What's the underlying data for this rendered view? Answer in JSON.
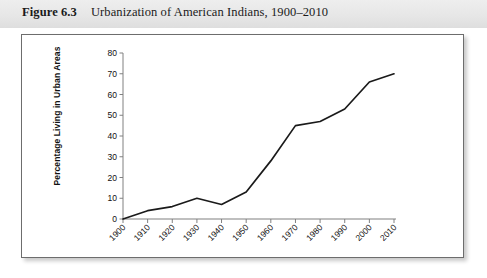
{
  "caption": {
    "label": "Figure 6.3",
    "title": "Urbanization of American Indians, 1900–2010"
  },
  "chart_data": {
    "type": "line",
    "title": "Urbanization of American Indians, 1900–2010",
    "xlabel": "",
    "ylabel": "Percentage Living in Urban Areas",
    "categories": [
      "1900",
      "1910",
      "1920",
      "1930",
      "1940",
      "1950",
      "1960",
      "1970",
      "1980",
      "1990",
      "2000",
      "2010"
    ],
    "x": [
      1900,
      1910,
      1920,
      1930,
      1940,
      1950,
      1960,
      1970,
      1980,
      1990,
      2000,
      2010
    ],
    "values": [
      0,
      4,
      6,
      10,
      7,
      13,
      28,
      45,
      47,
      53,
      66,
      70
    ],
    "series": [
      {
        "name": "Percentage Living in Urban Areas",
        "values": [
          0,
          4,
          6,
          10,
          7,
          13,
          28,
          45,
          47,
          53,
          66,
          70
        ]
      }
    ],
    "xlim": [
      1900,
      2010
    ],
    "ylim": [
      0,
      80
    ],
    "yticks": [
      0,
      10,
      20,
      30,
      40,
      50,
      60,
      70,
      80
    ],
    "ytick_labels": [
      "0",
      "10",
      "20",
      "30",
      "40",
      "50",
      "60",
      "70",
      "80"
    ],
    "xtick_labels": [
      "1900",
      "1910",
      "1920",
      "1930",
      "1940",
      "1950",
      "1960",
      "1970",
      "1980",
      "1990",
      "2000",
      "2010"
    ],
    "grid": false,
    "legend": false,
    "line_color": "#1a1a1a",
    "axis_color": "#808080",
    "background": "#ffffff"
  },
  "style": {
    "caption_band_color": "#e6e6e6",
    "panel_border_color": "#6d6d6d",
    "text_color": "#1a1a1a"
  }
}
